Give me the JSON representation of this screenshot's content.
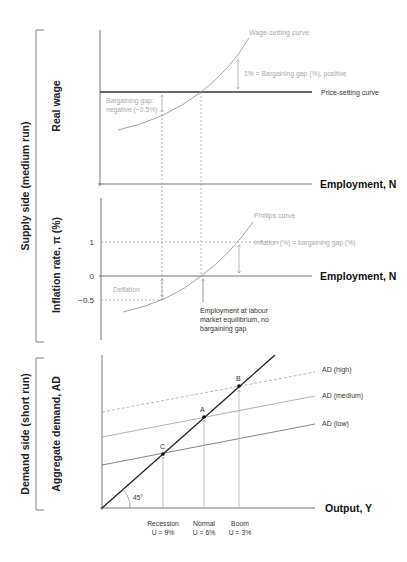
{
  "brackets": {
    "supply": "Supply side (medium run)",
    "demand": "Demand side (short run)"
  },
  "panel_top": {
    "y_label": "Real wage",
    "x_label": "Employment, N",
    "wage_curve_label": "Wage-setting curve",
    "price_curve_label": "Price-setting curve",
    "gap_positive_label": "1% = Bargaining gap (%), positive",
    "gap_negative_line1": "Bargaining gap:",
    "gap_negative_line2": "negative (−0.5%)"
  },
  "panel_mid": {
    "y_label": "Inflation rate, π (%)",
    "x_label": "Employment, N",
    "phillips_label": "Phillips curve",
    "inflation_eq_label": "Inflation (%) = bargaining gap (%)",
    "deflation_label": "Deflation",
    "tick_1": "1",
    "tick_0": "0",
    "tick_neg": "−0.5",
    "equilibrium_line1": "Employment at labour",
    "equilibrium_line2": "market equilibrium, no",
    "equilibrium_line3": "bargaining gap"
  },
  "panel_bottom": {
    "y_label": "Aggregate demand, AD",
    "x_label": "Output, Y",
    "ad_high": "AD (high)",
    "ad_medium": "AD (medium)",
    "ad_low": "AD (low)",
    "angle": "45°",
    "point_a": "A",
    "point_b": "B",
    "point_c": "C",
    "recession": "Recession",
    "recession_u": "U = 9%",
    "normal": "Normal",
    "normal_u": "U = 6%",
    "boom": "Boom",
    "boom_u": "U = 3%"
  },
  "colors": {
    "axis": "#555555",
    "dark": "#222222",
    "grey": "#9a9a9a",
    "light": "#b0b0b0"
  }
}
